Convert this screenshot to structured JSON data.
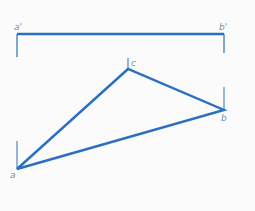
{
  "diagram": {
    "colors": {
      "line": "#2a6fc0",
      "label": "#6f8fb0",
      "background": "#fbfbfb"
    },
    "labels": {
      "a_prime": "a'",
      "b_prime": "b'",
      "a": "a",
      "b": "b",
      "c": "c"
    },
    "segment_ab_prime": {
      "x1": 17,
      "y1": 34,
      "x2": 224,
      "y2": 34
    },
    "triangle": {
      "a": {
        "x": 17,
        "y": 169
      },
      "b": {
        "x": 224,
        "y": 110
      },
      "c": {
        "x": 128,
        "y": 69
      }
    }
  }
}
